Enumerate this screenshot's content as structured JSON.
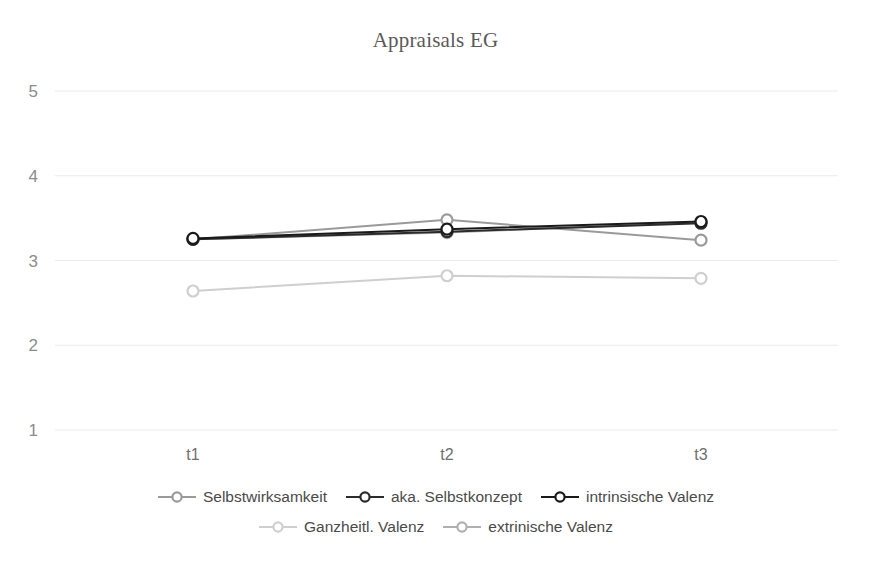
{
  "chart_data": {
    "type": "line",
    "title": "Appraisals EG",
    "xlabel": "",
    "ylabel": "",
    "categories": [
      "t1",
      "t2",
      "t3"
    ],
    "ylim": [
      1,
      5
    ],
    "yticks": [
      1,
      2,
      3,
      4,
      5
    ],
    "grid": true,
    "legend_position": "bottom",
    "series": [
      {
        "name": "Selbstwirksamkeit",
        "color": "#9a9a9a",
        "marker": "circle-open",
        "values": [
          3.25,
          3.48,
          3.24
        ]
      },
      {
        "name": "aka. Selbstkonzept",
        "color": "#2b2b2b",
        "marker": "circle-open",
        "values": [
          3.25,
          3.34,
          3.44
        ]
      },
      {
        "name": "intrinsische Valenz",
        "color": "#1a1a1a",
        "marker": "circle-open",
        "values": [
          3.26,
          3.37,
          3.46
        ]
      },
      {
        "name": "Ganzheitl. Valenz",
        "color": "#cfcfcf",
        "marker": "circle-open",
        "values": [
          2.64,
          2.82,
          2.79
        ]
      },
      {
        "name": "extrinische Valenz",
        "color": "#b0b0b0",
        "marker": "circle-open",
        "values": [
          3.25,
          3.33,
          3.45
        ]
      }
    ]
  },
  "axis": {
    "y_tick_labels": [
      "5",
      "4",
      "3",
      "2",
      "1"
    ],
    "x_tick_labels": [
      "t1",
      "t2",
      "t3"
    ]
  },
  "legend": {
    "row1": [
      {
        "label": "Selbstwirksamkeit",
        "color": "#9a9a9a"
      },
      {
        "label": "aka. Selbstkonzept",
        "color": "#2b2b2b"
      },
      {
        "label": "intrinsische Valenz",
        "color": "#1a1a1a"
      }
    ],
    "row2": [
      {
        "label": "Ganzheitl. Valenz",
        "color": "#cfcfcf"
      },
      {
        "label": "extrinische Valenz",
        "color": "#b0b0b0"
      }
    ]
  },
  "colors": {
    "background": "#ffffff",
    "gridline": "#ebebeb",
    "title_text": "#5a5a5a",
    "tick_text": "#8c8c8c"
  }
}
